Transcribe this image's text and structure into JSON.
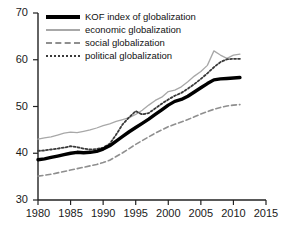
{
  "chart_data": {
    "type": "line",
    "title": "",
    "xlabel": "",
    "ylabel": "",
    "xlim": [
      1980,
      2015
    ],
    "ylim": [
      30,
      70
    ],
    "xticks": [
      "1980",
      "1985",
      "1990",
      "1995",
      "2000",
      "2005",
      "2010",
      "2015"
    ],
    "yticks": [
      "30",
      "40",
      "50",
      "60",
      "70"
    ],
    "grid": false,
    "legend_position": "top-left",
    "x": [
      1980,
      1981,
      1982,
      1983,
      1984,
      1985,
      1986,
      1987,
      1988,
      1989,
      1990,
      1991,
      1992,
      1993,
      1994,
      1995,
      1996,
      1997,
      1998,
      1999,
      2000,
      2001,
      2002,
      2003,
      2004,
      2005,
      2006,
      2007,
      2008,
      2009,
      2010,
      2011
    ],
    "series": [
      {
        "name": "KOF index of globalization",
        "color": "#000000",
        "style": "solid-thick",
        "values": [
          38.6,
          38.8,
          39.1,
          39.4,
          39.7,
          40.0,
          40.2,
          40.1,
          40.2,
          40.4,
          40.9,
          41.6,
          42.6,
          43.6,
          44.6,
          45.5,
          46.4,
          47.3,
          48.3,
          49.3,
          50.3,
          51.1,
          51.5,
          52.2,
          53.1,
          54.0,
          54.9,
          55.7,
          55.9,
          56.0,
          56.1,
          56.2
        ]
      },
      {
        "name": "economic globalization",
        "color": "#a8a8a8",
        "style": "solid-thin",
        "values": [
          43.0,
          43.3,
          43.5,
          43.9,
          44.3,
          44.5,
          44.4,
          44.7,
          45.0,
          45.4,
          45.9,
          46.3,
          46.8,
          47.2,
          47.6,
          48.3,
          49.2,
          50.3,
          51.3,
          52.0,
          53.2,
          53.5,
          54.2,
          55.3,
          56.5,
          57.5,
          58.8,
          61.9,
          61.0,
          60.3,
          61.0,
          61.2
        ]
      },
      {
        "name": "social globalization",
        "color": "#8f8f8f",
        "style": "dashed",
        "values": [
          35.1,
          35.3,
          35.5,
          35.8,
          36.1,
          36.4,
          36.7,
          37.0,
          37.3,
          37.6,
          38.0,
          38.5,
          39.3,
          40.1,
          41.0,
          41.9,
          42.7,
          43.5,
          44.3,
          45.0,
          45.7,
          46.2,
          46.7,
          47.2,
          47.8,
          48.4,
          48.9,
          49.4,
          49.8,
          50.1,
          50.3,
          50.4
        ]
      },
      {
        "name": "political globalization",
        "color": "#3a3a3a",
        "style": "dotted",
        "values": [
          40.5,
          40.6,
          40.8,
          41.0,
          41.2,
          41.5,
          41.3,
          41.0,
          40.8,
          40.9,
          41.2,
          42.0,
          44.0,
          46.2,
          47.7,
          49.0,
          48.3,
          48.6,
          49.6,
          50.6,
          51.5,
          52.3,
          52.9,
          53.8,
          54.8,
          55.9,
          57.1,
          58.4,
          59.5,
          60.1,
          60.2,
          60.2
        ]
      }
    ]
  },
  "legend": {
    "items": [
      {
        "label": "KOF index of globalization"
      },
      {
        "label": "economic globalization"
      },
      {
        "label": "social globalization"
      },
      {
        "label": "political globalization"
      }
    ]
  },
  "axes": {
    "y_tick_labels": [
      "70",
      "60",
      "50",
      "40",
      "30"
    ],
    "x_tick_labels": [
      "1980",
      "1985",
      "1990",
      "1995",
      "2000",
      "2005",
      "2010",
      "2015"
    ]
  }
}
